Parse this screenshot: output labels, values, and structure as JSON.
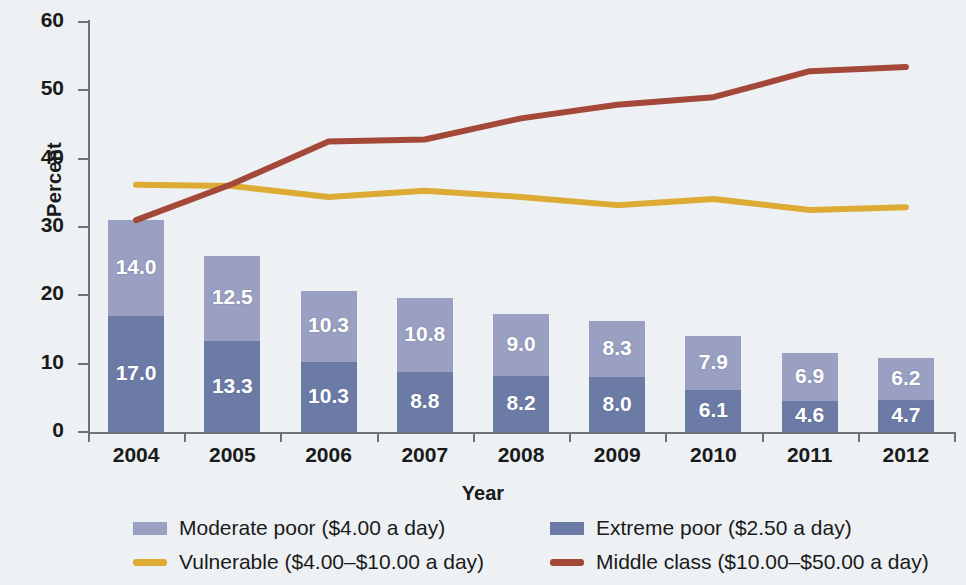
{
  "chart_data": {
    "type": "bar",
    "title": "",
    "xlabel": "Year",
    "ylabel": "Percent",
    "categories": [
      "2004",
      "2005",
      "2006",
      "2007",
      "2008",
      "2009",
      "2010",
      "2011",
      "2012"
    ],
    "ylim": [
      0,
      60
    ],
    "yticks": [
      0,
      10,
      20,
      30,
      40,
      50,
      60
    ],
    "ytick_labels": [
      "0",
      "10",
      "20",
      "30",
      "40",
      "50",
      "60"
    ],
    "grid": false,
    "legend_position": "bottom",
    "stacked": true,
    "series": [
      {
        "name": "Extreme poor ($2.50 a day)",
        "kind": "bar",
        "color": "#6c7ba6",
        "values": [
          17.0,
          13.3,
          10.3,
          8.8,
          8.2,
          8.0,
          6.1,
          4.6,
          4.7
        ],
        "labels": [
          "17.0",
          "13.3",
          "10.3",
          "8.8",
          "8.2",
          "8.0",
          "6.1",
          "4.6",
          "4.7"
        ]
      },
      {
        "name": "Moderate poor ($4.00 a day)",
        "kind": "bar",
        "color": "#9aa0c2",
        "values": [
          14.0,
          12.5,
          10.3,
          10.8,
          9.0,
          8.3,
          7.9,
          6.9,
          6.2
        ],
        "labels": [
          "14.0",
          "12.5",
          "10.3",
          "10.8",
          "9.0",
          "8.3",
          "7.9",
          "6.9",
          "6.2"
        ]
      },
      {
        "name": "Vulnerable ($4.00–$10.00 a day)",
        "kind": "line",
        "color": "#ddaa33",
        "values": [
          36.2,
          36.0,
          34.4,
          35.3,
          34.4,
          33.2,
          34.1,
          32.5,
          32.9
        ]
      },
      {
        "name": "Middle class ($10.00–$50.00 a day)",
        "kind": "line",
        "color": "#a4483a",
        "values": [
          31.0,
          36.3,
          42.5,
          42.8,
          45.9,
          47.9,
          49.0,
          52.8,
          53.4
        ]
      }
    ],
    "bar_totals": [
      31.0,
      25.8,
      20.6,
      19.6,
      17.2,
      16.3,
      14.0,
      11.5,
      10.9
    ]
  },
  "axes": {
    "y_title": "Percent",
    "x_title": "Year"
  },
  "legend": {
    "items": [
      {
        "label": "Moderate poor ($4.00 a day)",
        "color": "#9aa0c2",
        "marker": "box",
        "icon": "legend-swatch-box"
      },
      {
        "label": "Extreme poor ($2.50 a day)",
        "color": "#6c7ba6",
        "marker": "box",
        "icon": "legend-swatch-box"
      },
      {
        "label": "Vulnerable ($4.00–$10.00 a day)",
        "color": "#ddaa33",
        "marker": "line",
        "icon": "legend-swatch-line"
      },
      {
        "label": "Middle class ($10.00–$50.00 a day)",
        "color": "#a4483a",
        "marker": "line",
        "icon": "legend-swatch-line"
      }
    ]
  },
  "colors": {
    "background": "#eef1f3",
    "axis": "#6d7275",
    "moderate_poor": "#9aa0c2",
    "extreme_poor": "#6c7ba6",
    "vulnerable": "#ddaa33",
    "middle_class": "#a4483a",
    "bar_label_text": "#ffffff"
  }
}
